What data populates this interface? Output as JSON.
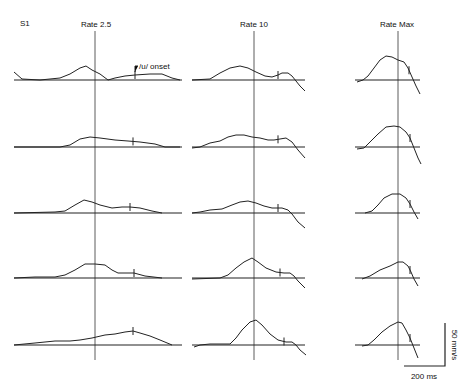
{
  "figure": {
    "subject_label": "S1",
    "columns": [
      {
        "title": "Rate 2.5"
      },
      {
        "title": "Rate 10"
      },
      {
        "title": "Rate Max"
      }
    ],
    "annotation": "/u/ onset",
    "scale_bar": {
      "vertical_label": "50 mm/s",
      "horizontal_label": "200 ms"
    }
  },
  "chart_data": {
    "type": "line",
    "columns": [
      "Rate 2.5",
      "Rate 10",
      "Rate Max"
    ],
    "rows": 5,
    "annotation": "/u/ onset marked by vertical tick on each trace",
    "scale": {
      "vertical": "50 mm/s",
      "horizontal": "200 ms"
    },
    "note": "Traces are aligned at a vertical reference line per column; shapes digitized approximately as SVG polyline points",
    "traces": {
      "rate_2_5": [
        {
          "row": 1,
          "baseline_y": 80,
          "points": "14,72 22,79 40,80 60,78 70,74 80,68 86,66 92,70 100,74 108,80 115,78 125,76 135,75 150,74 162,74 172,78 180,80",
          "onset_x": 135
        },
        {
          "row": 2,
          "baseline_y": 147,
          "points": "14,147 60,147 70,145 80,139 90,137 100,138 115,140 128,141 140,142 155,144 165,147 180,147",
          "onset_x": 133
        },
        {
          "row": 3,
          "baseline_y": 213,
          "points": "14,213 55,212 65,211 75,205 84,200 92,202 100,205 112,208 122,207 130,207 140,208 152,211 162,213",
          "onset_x": 130
        },
        {
          "row": 4,
          "baseline_y": 278,
          "points": "14,278 35,277 55,277 65,275 75,270 85,264 95,264 105,265 112,270 118,273 128,273 134,273 145,276 162,278",
          "onset_x": 134
        },
        {
          "row": 5,
          "baseline_y": 345,
          "points": "14,345 35,343 55,341 70,341 80,340 92,338 105,335 115,334 125,332 133,331 140,333 150,336 160,340 172,345",
          "onset_x": 133
        }
      ],
      "rate_10": [
        {
          "row": 1,
          "baseline_y": 80,
          "points": "192,80 210,79 220,73 230,68 240,66 248,68 256,72 265,76 272,77 278,75 282,73 288,73 292,76 296,81 300,86 305,91",
          "onset_x": 278
        },
        {
          "row": 2,
          "baseline_y": 147,
          "points": "192,148 200,147 210,143 220,141 228,137 236,135 244,135 252,137 260,138 268,140 274,140 280,139 286,138 292,142 298,150 305,158",
          "onset_x": 278
        },
        {
          "row": 3,
          "baseline_y": 213,
          "points": "192,213 200,212 210,210 222,209 232,205 240,202 248,201 256,203 264,206 272,208 282,208 288,210 292,214 298,222 305,228",
          "onset_x": 278
        },
        {
          "row": 4,
          "baseline_y": 278,
          "points": "192,279 220,278 228,275 236,268 244,262 252,258 258,262 266,268 276,272 284,273 290,273 294,276 298,281 305,288",
          "onset_x": 280
        },
        {
          "row": 5,
          "baseline_y": 345,
          "points": "194,347 200,345 210,344 230,344 236,338 242,330 250,322 256,320 262,325 270,334 278,340 286,342 292,342 296,345 300,350 306,355",
          "onset_x": 284
        }
      ],
      "rate_max": [
        {
          "row": 1,
          "baseline_y": 80,
          "points": "357,82 363,80 368,76 374,68 380,60 386,56 392,57 398,60 404,62 408,68 412,77 416,86 420,94",
          "onset_x": 409
        },
        {
          "row": 2,
          "baseline_y": 147,
          "points": "357,149 364,148 370,142 378,134 386,127 394,126 400,127 406,132 410,138 414,148 418,158 421,164",
          "onset_x": 410
        },
        {
          "row": 3,
          "baseline_y": 213,
          "points": "365,213 372,211 378,205 384,198 392,194 400,194 406,198 410,204 414,212 418,219",
          "onset_x": 410
        },
        {
          "row": 4,
          "baseline_y": 278,
          "points": "362,279 370,276 380,270 390,266 398,262 403,262 408,266 411,272 414,279 418,286",
          "onset_x": 410
        },
        {
          "row": 5,
          "baseline_y": 345,
          "points": "362,346 368,345 374,340 382,332 390,326 398,322 402,323 406,330 410,338 414,348 418,358",
          "onset_x": 410
        }
      ]
    }
  }
}
